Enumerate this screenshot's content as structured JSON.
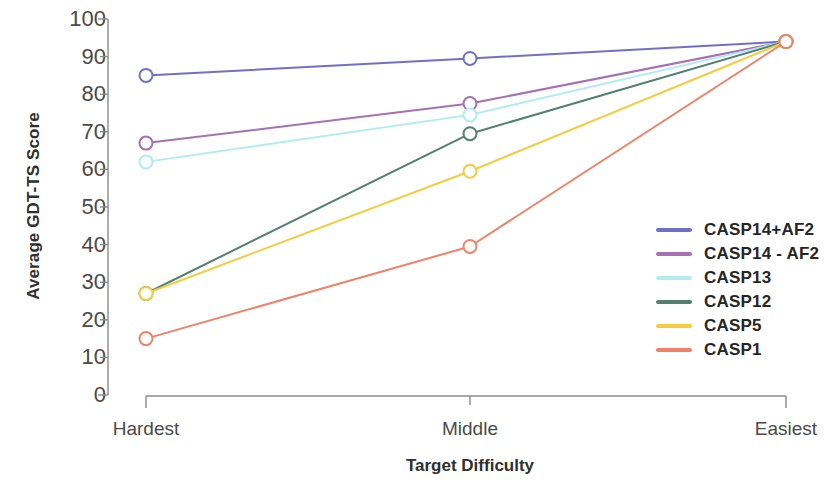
{
  "chart_data": {
    "type": "line",
    "title": "",
    "xlabel": "Target Difficulty",
    "ylabel": "Average GDT-TS Score",
    "categories": [
      "Hardest",
      "Middle",
      "Easiest"
    ],
    "ylim": [
      0,
      100
    ],
    "ytick_labels": [
      "100",
      "90",
      "80",
      "70",
      "60",
      "50",
      "40",
      "30",
      "20",
      "10",
      "0"
    ],
    "yticks": [
      100,
      90,
      80,
      70,
      60,
      50,
      40,
      30,
      20,
      10,
      0
    ],
    "grid": false,
    "legend_position": "right",
    "marker": "open-circle",
    "series": [
      {
        "name": "CASP14+AF2",
        "color": "#6f70c8",
        "values": [
          85.0,
          89.5,
          94.0
        ]
      },
      {
        "name": "CASP14 - AF2",
        "color": "#a householdm",
        "values": [
          67.0,
          77.5,
          94.0
        ]
      },
      {
        "name": "CASP13",
        "color": "#b2ecf2",
        "values": [
          62.0,
          74.5,
          94.0
        ]
      },
      {
        "name": "CASP12",
        "color": "#52806e",
        "values": [
          27.0,
          69.5,
          94.0
        ]
      },
      {
        "name": "CASP5",
        "color": "#f5cc3f",
        "values": [
          27.0,
          59.5,
          94.0
        ]
      },
      {
        "name": "CASP1",
        "color": "#f08268",
        "values": [
          15.0,
          39.5,
          94.0
        ]
      }
    ]
  },
  "legend": {
    "items": [
      {
        "label": "CASP14+AF2",
        "color": "#6f70c8"
      },
      {
        "label": "CASP14 - AF2",
        "color": "#a86fb4"
      },
      {
        "label": "CASP13",
        "color": "#b2ecf2"
      },
      {
        "label": "CASP12",
        "color": "#52806e"
      },
      {
        "label": "CASP5",
        "color": "#f5cc3f"
      },
      {
        "label": "CASP1",
        "color": "#f08268"
      }
    ]
  },
  "axes": {
    "y_title": "Average GDT-TS Score",
    "x_title": "Target Difficulty"
  }
}
